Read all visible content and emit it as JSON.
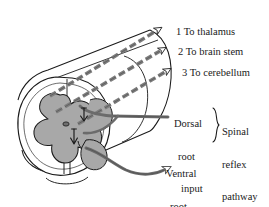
{
  "figure": {
    "background_color": "#ffffff",
    "ink_color": "#1a1a1a",
    "gray_matter_color": "#a8a8a8",
    "white_matter_color": "#ffffff"
  },
  "tracts": [
    {
      "number": "1",
      "label": "1 To thalamus",
      "arrow": "open-arrowhead",
      "style": "dashed"
    },
    {
      "number": "2",
      "label": "2 To brain stem",
      "arrow": "open-arrowhead",
      "style": "dashed"
    },
    {
      "number": "3",
      "label": "3 To cerebellum",
      "arrow": "open-arrowhead",
      "style": "dashed"
    }
  ],
  "roots": {
    "dorsal": {
      "line1": "Dorsal",
      "line2": "root",
      "line3": "input"
    },
    "ventral": {
      "line1": "Ventral",
      "line2": "root",
      "line3": "output"
    }
  },
  "brace": {
    "line1": "Spinal",
    "line2": "reflex",
    "line3": "pathway",
    "glyph": "right-curly-brace"
  }
}
